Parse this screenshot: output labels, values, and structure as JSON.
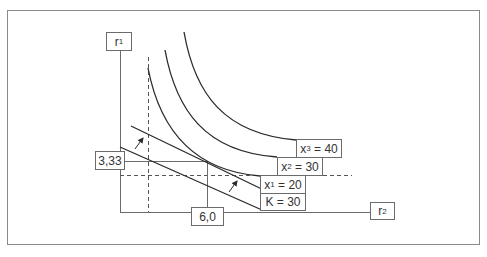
{
  "diagram": {
    "type": "isoquant-isocost",
    "axes": {
      "y_label": {
        "base": "r",
        "sub": "1"
      },
      "x_label": {
        "base": "r",
        "sub": "2"
      }
    },
    "optimum": {
      "r1_value": "3,33",
      "r2_value": "6,0"
    },
    "isocost": {
      "label": "K = 30"
    },
    "isoquants": [
      {
        "base": "x",
        "sub": "1",
        "rest": " = 20"
      },
      {
        "base": "x",
        "sub": "2",
        "rest": " = 30"
      },
      {
        "base": "x",
        "sub": "3",
        "rest": " = 40"
      }
    ],
    "colors": {
      "line": "#2a2a2a",
      "axis": "#6b6b6b",
      "frame": "#8a8a8a",
      "dashed": "#555555"
    }
  }
}
